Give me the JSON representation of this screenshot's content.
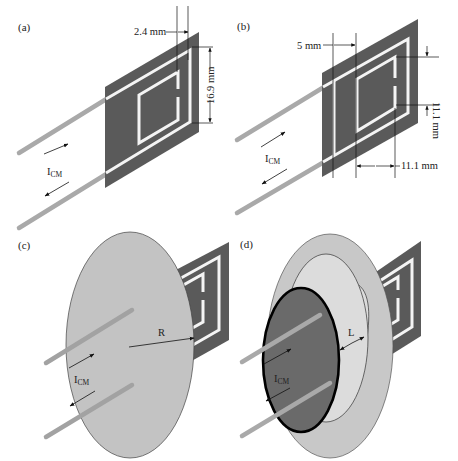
{
  "figure": {
    "colors": {
      "plate": "#5a5a5a",
      "trace": "#f4f4f4",
      "wire": "#a9a9a9",
      "shield_disk": "#c3c3c3",
      "shield_outer": "#c8c8c8",
      "shield_inner_cylinder": "#dcdcdc",
      "dark_disk": "#6a6a6a",
      "line": "#111111"
    },
    "panels": [
      {
        "id": "a",
        "label": "(a)",
        "current_label": "I",
        "current_subscript": "CM",
        "dimensions": [
          {
            "label": "2.4 mm",
            "orientation": "horizontal"
          },
          {
            "label": "16.9 mm",
            "orientation": "vertical"
          }
        ]
      },
      {
        "id": "b",
        "label": "(b)",
        "current_label": "I",
        "current_subscript": "CM",
        "dimensions": [
          {
            "label": "5 mm",
            "orientation": "horizontal"
          },
          {
            "label": "11.1 mm",
            "orientation": "vertical"
          },
          {
            "label": "11.1 mm",
            "orientation": "horizontal"
          }
        ]
      },
      {
        "id": "c",
        "label": "(c)",
        "current_label": "I",
        "current_subscript": "CM",
        "dimensions": [
          {
            "label": "R",
            "orientation": "radial"
          }
        ]
      },
      {
        "id": "d",
        "label": "(d)",
        "current_label": "I",
        "current_subscript": "CM",
        "dimensions": [
          {
            "label": "L",
            "orientation": "radial"
          }
        ]
      }
    ]
  }
}
